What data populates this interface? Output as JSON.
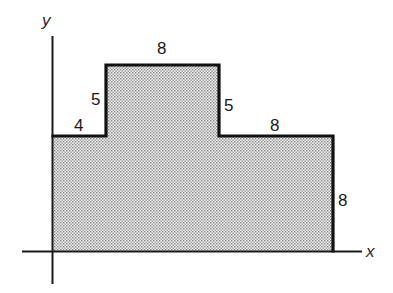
{
  "figure": {
    "type": "composite-rectangle-area-diagram",
    "axes": {
      "x_label": "x",
      "y_label": "y"
    },
    "shape": {
      "fill_pattern": "stippled-gray",
      "outline_color": "#111111",
      "fill_color": "#d4d4d4",
      "vertices_units": [
        [
          0,
          0
        ],
        [
          0,
          8
        ],
        [
          4,
          8
        ],
        [
          4,
          13
        ],
        [
          12,
          13
        ],
        [
          12,
          8
        ],
        [
          20,
          8
        ],
        [
          20,
          0
        ]
      ]
    },
    "dimensions": [
      {
        "id": "left-step-width",
        "value": "4"
      },
      {
        "id": "left-step-rise",
        "value": "5"
      },
      {
        "id": "top-width",
        "value": "8"
      },
      {
        "id": "right-step-drop",
        "value": "5"
      },
      {
        "id": "right-step-width",
        "value": "8"
      },
      {
        "id": "right-height",
        "value": "8"
      }
    ]
  }
}
